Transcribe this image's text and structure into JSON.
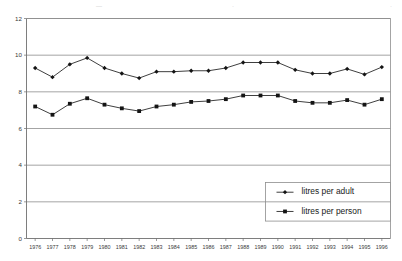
{
  "top_strip": {
    "note": "faint cut-off text row at top edge of scanned page",
    "segments": [
      {
        "text": "—",
        "x": 96
      },
      {
        "text": "·",
        "x": 232
      },
      {
        "text": "·",
        "x": 390
      }
    ]
  },
  "chart_data": {
    "type": "line",
    "title": "",
    "subtitle": "",
    "xlabel": "",
    "ylabel": "",
    "ylim": [
      0,
      12
    ],
    "yticks": [
      0,
      2,
      4,
      6,
      8,
      10,
      12
    ],
    "ytick_labels": [
      "0",
      "2",
      "4",
      "6",
      "8",
      "10",
      "12"
    ],
    "grid": true,
    "grid_axis": "y",
    "legend_position": "lower right",
    "categories": [
      "1976",
      "1977",
      "1978",
      "1979",
      "1980",
      "1981",
      "1982",
      "1983",
      "1984",
      "1985",
      "1986",
      "1987",
      "1988",
      "1989",
      "1990",
      "1991",
      "1992",
      "1993",
      "1994",
      "1995",
      "1996"
    ],
    "x": [
      1976,
      1977,
      1978,
      1979,
      1980,
      1981,
      1982,
      1983,
      1984,
      1985,
      1986,
      1987,
      1988,
      1989,
      1990,
      1991,
      1992,
      1993,
      1994,
      1995,
      1996
    ],
    "series": [
      {
        "name": "litres per adult",
        "marker": "diamond",
        "color": "#141414",
        "values": [
          9.3,
          8.8,
          9.5,
          9.85,
          9.3,
          9.0,
          8.75,
          9.1,
          9.1,
          9.15,
          9.15,
          9.3,
          9.6,
          9.6,
          9.6,
          9.2,
          9.0,
          9.0,
          9.25,
          8.95,
          9.35
        ]
      },
      {
        "name": "litres per person",
        "marker": "square",
        "color": "#141414",
        "values": [
          7.2,
          6.75,
          7.35,
          7.65,
          7.3,
          7.1,
          6.95,
          7.2,
          7.3,
          7.45,
          7.5,
          7.6,
          7.8,
          7.8,
          7.8,
          7.5,
          7.4,
          7.4,
          7.55,
          7.3,
          7.6
        ]
      }
    ]
  },
  "legend": {
    "entries": [
      {
        "label": "litres per adult",
        "marker": "diamond"
      },
      {
        "label": "litres per person",
        "marker": "square"
      }
    ]
  }
}
